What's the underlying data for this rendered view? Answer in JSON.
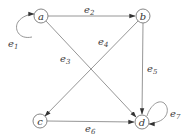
{
  "diagram": {
    "type": "directed-graph",
    "nodes": [
      {
        "id": "a",
        "label": "a",
        "x": 41,
        "y": 16
      },
      {
        "id": "b",
        "label": "b",
        "x": 143,
        "y": 16
      },
      {
        "id": "c",
        "label": "c",
        "x": 40,
        "y": 121
      },
      {
        "id": "d",
        "label": "d",
        "x": 142,
        "y": 122
      }
    ],
    "edges": [
      {
        "id": "e1",
        "label": "e",
        "sub": "1",
        "from": "a",
        "to": "a"
      },
      {
        "id": "e2",
        "label": "e",
        "sub": "2",
        "from": "a",
        "to": "b"
      },
      {
        "id": "e3",
        "label": "e",
        "sub": "3",
        "from": "a",
        "to": "d"
      },
      {
        "id": "e4",
        "label": "e",
        "sub": "4",
        "from": "b",
        "to": "c"
      },
      {
        "id": "e5",
        "label": "e",
        "sub": "5",
        "from": "b",
        "to": "d"
      },
      {
        "id": "e6",
        "label": "e",
        "sub": "6",
        "from": "c",
        "to": "d"
      },
      {
        "id": "e7",
        "label": "e",
        "sub": "7",
        "from": "d",
        "to": "d"
      }
    ]
  }
}
